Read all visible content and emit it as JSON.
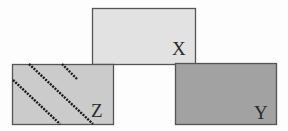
{
  "diagram": {
    "width": 288,
    "height": 131,
    "boxes": [
      {
        "id": "X",
        "label": "X",
        "x": 92,
        "y": 8,
        "w": 103,
        "h": 56,
        "fill": "#e2e2e2",
        "stroke": "#555555",
        "label_x": 172,
        "label_y": 55
      },
      {
        "id": "Z",
        "label": "Z",
        "x": 12,
        "y": 64,
        "w": 101,
        "h": 60,
        "fill": "#cbcbcb",
        "stroke": "#555555",
        "label_x": 91,
        "label_y": 117,
        "pattern": "dotted-diagonals"
      },
      {
        "id": "Y",
        "label": "Y",
        "x": 175,
        "y": 63,
        "w": 101,
        "h": 61,
        "fill": "#a2a2a2",
        "stroke": "#555555",
        "label_x": 254,
        "label_y": 119
      }
    ],
    "z_diagonals": [
      {
        "x1": 13,
        "y1": 80,
        "x2": 60,
        "y2": 124
      },
      {
        "x1": 29,
        "y1": 64,
        "x2": 93,
        "y2": 124
      },
      {
        "x1": 62,
        "y1": 64,
        "x2": 77,
        "y2": 79
      }
    ],
    "diagonal_color": "#1a1a1a"
  }
}
